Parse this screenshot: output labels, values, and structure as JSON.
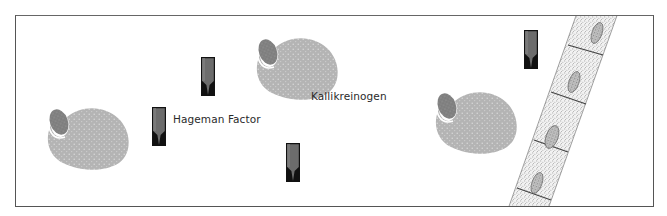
{
  "figure": {
    "labels": {
      "hageman": "Hageman Factor",
      "kallikreinogen": "Kallikreinogen"
    },
    "colors": {
      "frame": "#555555",
      "paisley_body": "#b4b4b4",
      "paisley_nucleus": "#808080",
      "marker_fill": "#6a6a6a",
      "marker_tip": "#111111",
      "membrane_stipple": "#3a3a3a"
    },
    "elements": {
      "paisley_molecules": [
        {
          "id": "paisley-left",
          "x": 43,
          "y": 103
        },
        {
          "id": "paisley-top",
          "x": 252,
          "y": 35
        },
        {
          "id": "paisley-right",
          "x": 431,
          "y": 87
        }
      ],
      "markers": [
        {
          "id": "marker-1",
          "x": 201,
          "y": 57
        },
        {
          "id": "marker-hageman",
          "x": 152,
          "y": 107
        },
        {
          "id": "marker-3",
          "x": 286,
          "y": 143
        },
        {
          "id": "marker-4",
          "x": 524,
          "y": 30
        }
      ],
      "membrane_cells": 4
    }
  }
}
